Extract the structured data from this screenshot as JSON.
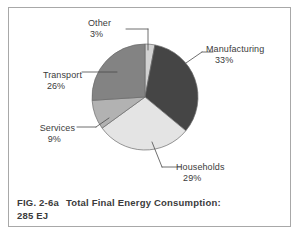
{
  "figure": {
    "frame_color": "#a8a8a8",
    "background": "#ffffff",
    "caption_figure_number": "FIG. 2-6a",
    "caption_title": "Total Final Energy Consumption:",
    "caption_subtitle": "285 EJ"
  },
  "labels": {
    "manufacturing": {
      "name": "Manufacturing",
      "percent": "33%"
    },
    "households": {
      "name": "Households",
      "percent": "29%"
    },
    "transport": {
      "name": "Transport",
      "percent": "26%"
    },
    "services": {
      "name": "Services",
      "percent": "9%"
    },
    "other": {
      "name": "Other",
      "percent": "3%"
    }
  },
  "chart_data": {
    "type": "pie",
    "title": "Total Final Energy Consumption: 285 EJ",
    "xlabel": "",
    "ylabel": "",
    "units": "EJ",
    "total": 285,
    "grid": false,
    "legend": "none",
    "labels_position": "outside-with-leader-lines",
    "start_angle_deg": -90,
    "direction": "clockwise",
    "categories": [
      "Other",
      "Manufacturing",
      "Households",
      "Services",
      "Transport"
    ],
    "values": [
      3,
      33,
      29,
      9,
      26
    ],
    "value_labels": [
      "3%",
      "33%",
      "29%",
      "9%",
      "26%"
    ],
    "colors": [
      "#d2d2d2",
      "#454545",
      "#e4e4e4",
      "#b2b2b2",
      "#838383"
    ],
    "slices": [
      {
        "label": "Other",
        "percent": 3,
        "color": "#d2d2d2",
        "start_deg": -90,
        "end_deg": -79.2
      },
      {
        "label": "Manufacturing",
        "percent": 33,
        "color": "#454545",
        "start_deg": -79.2,
        "end_deg": 39.6
      },
      {
        "label": "Households",
        "percent": 29,
        "color": "#e4e4e4",
        "start_deg": 39.6,
        "end_deg": 144.0
      },
      {
        "label": "Services",
        "percent": 9,
        "color": "#b2b2b2",
        "start_deg": 144.0,
        "end_deg": 176.4
      },
      {
        "label": "Transport",
        "percent": 26,
        "color": "#838383",
        "start_deg": 176.4,
        "end_deg": 270.0
      }
    ]
  }
}
